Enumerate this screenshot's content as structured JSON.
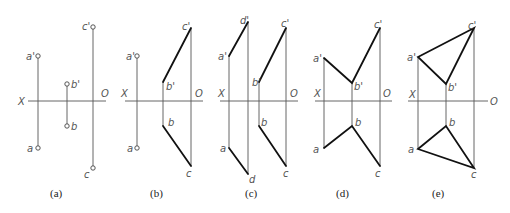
{
  "figure": {
    "axis_labels": {
      "x": "X",
      "o": "O"
    },
    "panels": [
      {
        "caption": "(a)",
        "labels": {
          "a_prime": "a'",
          "a": "a",
          "b_prime": "b'",
          "b": "b",
          "c_prime": "c'",
          "c": "c"
        }
      },
      {
        "caption": "(b)",
        "labels": {
          "a_prime": "a'",
          "a": "a",
          "b_prime": "b'",
          "b": "b",
          "c_prime": "c'",
          "c": "c"
        }
      },
      {
        "caption": "(c)",
        "labels": {
          "d_prime": "d'",
          "a_prime": "a'",
          "a": "a",
          "d": "d",
          "b_prime": "b'",
          "b": "b",
          "c_prime": "c'",
          "c": "c"
        }
      },
      {
        "caption": "(d)",
        "labels": {
          "a_prime": "a'",
          "a": "a",
          "b_prime": "b'",
          "b": "b",
          "c_prime": "c'",
          "c": "c"
        }
      },
      {
        "caption": "(e)",
        "labels": {
          "a_prime": "a'",
          "a": "a",
          "b_prime": "b'",
          "b": "b",
          "c_prime": "c'",
          "c": "c"
        }
      }
    ]
  }
}
